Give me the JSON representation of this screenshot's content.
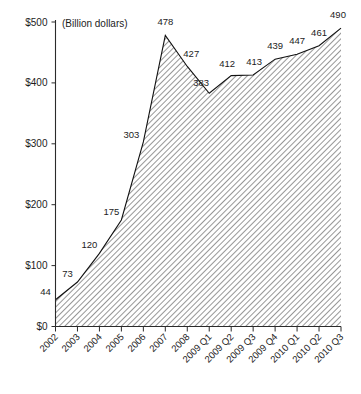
{
  "chart_data": {
    "type": "area",
    "title": "",
    "subtitle": "",
    "unit_caption": "(Billion dollars)",
    "xlabel": "",
    "ylabel": "",
    "ylim": [
      0,
      500
    ],
    "grid": false,
    "legend": "none",
    "categories": [
      "2002",
      "2003",
      "2004",
      "2005",
      "2006",
      "2007",
      "2008",
      "2009 Q1",
      "2009 Q2",
      "2009 Q3",
      "2009 Q4",
      "2010 Q1",
      "2010 Q2",
      "2010 Q3"
    ],
    "values": [
      44,
      73,
      120,
      175,
      303,
      478,
      427,
      383,
      412,
      413,
      439,
      447,
      461,
      490
    ],
    "point_labels": [
      "44",
      "73",
      "120",
      "175",
      "303",
      "478",
      "427",
      "383",
      "412",
      "413",
      "439",
      "447",
      "461",
      "490"
    ],
    "ytick_values": [
      0,
      100,
      200,
      300,
      400,
      500
    ],
    "ytick_labels": [
      "$0",
      "$100",
      "$200",
      "$300",
      "$400",
      "$500"
    ],
    "fill_style": "diagonal-hatch",
    "colors": {
      "line": "#111111",
      "hatch": "#4a4a4a",
      "background": "#ffffff",
      "axis": "#2b2b2b",
      "text": "#1c1c1c"
    }
  }
}
